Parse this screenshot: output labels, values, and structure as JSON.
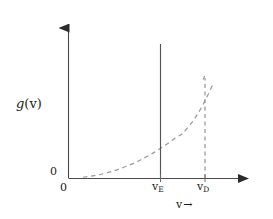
{
  "figure": {
    "kind": "line-plot",
    "background_color": "#ffffff",
    "line_color": "#2b2b2b",
    "axis_color": "#3a3a3a",
    "curve_color": "#9a9a9a",
    "dash_color": "#8f8f8f"
  },
  "labels": {
    "ylabel_main": "g",
    "ylabel_paren_open": "(",
    "ylabel_arg": "v",
    "ylabel_paren_close": ")",
    "ylabel_full": "g(v)",
    "origin_y": "0",
    "origin_x": "0",
    "xlabel_symbol": "v",
    "xlabel_arrow": "→",
    "xlabel_full": "v →"
  },
  "ticks": {
    "x": [
      {
        "name": "v-sub-E",
        "symbol": "v",
        "subscript": "E",
        "text": "vE",
        "pixel_x": 160
      },
      {
        "name": "v-sub-D",
        "symbol": "v",
        "subscript": "D",
        "text": "vD",
        "pixel_x": 205
      }
    ]
  },
  "chart_data": {
    "type": "line",
    "title": "",
    "xlabel": "v →",
    "ylabel": "g(v)",
    "grid": false,
    "legend": "none",
    "xlim": [
      0,
      1.24
    ],
    "ylim": [
      0,
      1.0
    ],
    "axis_arrows": {
      "x": "right",
      "y": "up"
    },
    "annotations": [
      {
        "name": "v-sub-E-line",
        "type": "vertical-line",
        "style": "solid",
        "x": 0.79,
        "y_from": 0.0,
        "y_to": 0.93,
        "label": "vE"
      },
      {
        "name": "v-sub-D-line",
        "type": "vertical-line",
        "style": "dashed",
        "x": 1.0,
        "y_from": 0.0,
        "y_to": 0.63,
        "label": "vD"
      }
    ],
    "series": [
      {
        "name": "density-of-states",
        "style": "dashed",
        "description": "parabolic rise from 0 to a cutoff peak at vD",
        "x": [
          0.1,
          0.18,
          0.26,
          0.34,
          0.42,
          0.5,
          0.58,
          0.66,
          0.74,
          0.79,
          0.86,
          0.93,
          1.0
        ],
        "y": [
          0.005,
          0.016,
          0.033,
          0.056,
          0.086,
          0.122,
          0.164,
          0.213,
          0.268,
          0.3,
          0.38,
          0.49,
          0.63
        ]
      }
    ]
  }
}
